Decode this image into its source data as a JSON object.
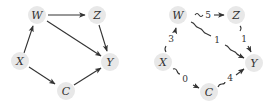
{
  "diagrams": [
    {
      "name": "causal-dag",
      "nodes": [
        {
          "id": "W",
          "label": "W"
        },
        {
          "id": "Z",
          "label": "Z"
        },
        {
          "id": "X",
          "label": "X"
        },
        {
          "id": "Y",
          "label": "Y"
        },
        {
          "id": "C",
          "label": "C"
        }
      ],
      "edges": [
        {
          "from": "X",
          "to": "W"
        },
        {
          "from": "W",
          "to": "Z"
        },
        {
          "from": "W",
          "to": "Y"
        },
        {
          "from": "Z",
          "to": "Y"
        },
        {
          "from": "X",
          "to": "C"
        },
        {
          "from": "C",
          "to": "Y"
        }
      ]
    },
    {
      "name": "weighted-path-graph",
      "nodes": [
        {
          "id": "W",
          "label": "W"
        },
        {
          "id": "Z",
          "label": "Z"
        },
        {
          "id": "X",
          "label": "X"
        },
        {
          "id": "Y",
          "label": "Y"
        },
        {
          "id": "C",
          "label": "C"
        }
      ],
      "edges": [
        {
          "from": "X",
          "to": "W",
          "weight": "3"
        },
        {
          "from": "W",
          "to": "Z",
          "weight": "5"
        },
        {
          "from": "W",
          "to": "Y",
          "weight": "1"
        },
        {
          "from": "Z",
          "to": "Y",
          "weight": "1"
        },
        {
          "from": "X",
          "to": "C",
          "weight": "0"
        },
        {
          "from": "C",
          "to": "Y",
          "weight": "4"
        }
      ]
    }
  ]
}
